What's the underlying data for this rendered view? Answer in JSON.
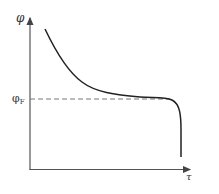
{
  "diagram": {
    "type": "curve-plot",
    "y_axis_label": "φ",
    "x_axis_label": "τ",
    "reference_line": {
      "label_main": "φ",
      "label_sub": "F",
      "style": "dashed"
    },
    "curve_description": "Decreasing curve that flattens near φ_F then drops sharply"
  },
  "colors": {
    "axis": "#555555",
    "curve": "#222222",
    "dashed": "#777777",
    "background": "#ffffff"
  }
}
